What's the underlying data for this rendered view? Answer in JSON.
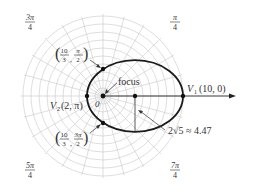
{
  "diagram": {
    "type": "polar-ellipse",
    "pole": {
      "x": 103,
      "y": 96,
      "label": "0"
    },
    "scale_px_per_unit": 8,
    "grid": {
      "rings": 10,
      "ring_step_units": 1,
      "radial_step_deg": 15,
      "color": "#c8c8c8"
    },
    "axis": {
      "label_end_x": 236
    },
    "angle_labels": [
      {
        "id": "a3pi4",
        "num": "3π",
        "den": "4",
        "x": 30,
        "y": 20
      },
      {
        "id": "api4",
        "num": "π",
        "den": "4",
        "x": 175,
        "y": 20
      },
      {
        "id": "a5pi4",
        "num": "5π",
        "den": "4",
        "x": 30,
        "y": 168
      },
      {
        "id": "a7pi4",
        "num": "7π",
        "den": "4",
        "x": 175,
        "y": 168
      }
    ],
    "ellipse": {
      "cx": 135,
      "cy": 96,
      "rx": 48,
      "ry": 35.8,
      "color": "#1a1a1a"
    },
    "points": [
      {
        "id": "V1",
        "x": 183,
        "y": 96,
        "label": "V",
        "sub": "1",
        "coords": "(10, 0)"
      },
      {
        "id": "V2",
        "x": 87,
        "y": 96,
        "label": "V",
        "sub": "2",
        "coords": "(2, π)"
      },
      {
        "id": "p_pi2",
        "x": 103,
        "y": 69,
        "frac_num": "10",
        "frac_den": "3",
        "angle_num": "π",
        "angle_den": "2"
      },
      {
        "id": "p_3pi2",
        "x": 103,
        "y": 123,
        "frac_num": "10",
        "frac_den": "3",
        "angle_num": "3π",
        "angle_den": "2"
      },
      {
        "id": "center",
        "x": 135,
        "y": 96
      }
    ],
    "focus_label": "focus",
    "semi_minor_label": "2√5 ≈ 4.47"
  }
}
